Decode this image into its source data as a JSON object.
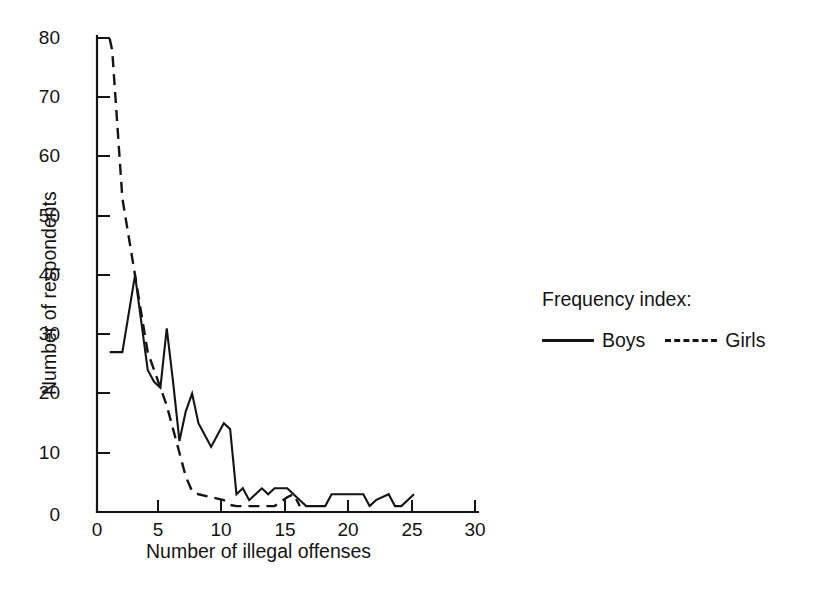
{
  "chart_data": {
    "type": "line",
    "title": "",
    "xlabel": "Number of illegal offenses",
    "ylabel": "Number of respondents",
    "xlim": [
      0,
      30
    ],
    "ylim": [
      0,
      80
    ],
    "xticks": [
      "0",
      "5",
      "10",
      "15",
      "20",
      "25",
      "30"
    ],
    "yticks": [
      "0",
      "10",
      "20",
      "30",
      "40",
      "50",
      "60",
      "70",
      "80"
    ],
    "grid": false,
    "legend_position": "right",
    "legend_title": "Frequency index:",
    "series": [
      {
        "name": "Boys",
        "style": "solid",
        "color": "#141414",
        "x": [
          1,
          2,
          3,
          4,
          4.5,
          5,
          5.5,
          6,
          6.5,
          7,
          7.5,
          8,
          8.5,
          9,
          9.5,
          10,
          10.5,
          11,
          11.5,
          12,
          12.5,
          13,
          13.5,
          14,
          14.5,
          15,
          15.5,
          16,
          16.5,
          17,
          18,
          18.5,
          19,
          20,
          21,
          21.5,
          22,
          23,
          23.5,
          24,
          25
        ],
        "y": [
          27,
          27,
          40,
          24,
          22,
          21,
          31,
          22,
          12,
          17,
          20,
          15,
          13,
          11,
          13,
          15,
          14,
          3,
          4,
          2,
          3,
          4,
          3,
          4,
          4,
          4,
          3,
          2,
          1,
          1,
          1,
          3,
          3,
          3,
          3,
          1,
          2,
          3,
          1,
          1,
          3
        ]
      },
      {
        "name": "Girls",
        "style": "dashed",
        "color": "#141414",
        "x": [
          1,
          1.2,
          2,
          3,
          4,
          5,
          5.5,
          6,
          6.5,
          7,
          7.5,
          8,
          9,
          10,
          10.5,
          11,
          12,
          13,
          14,
          15,
          15.5,
          16
        ],
        "y": [
          80,
          78,
          53,
          40,
          27,
          21,
          18,
          14,
          10,
          6,
          3.5,
          3,
          2.5,
          2,
          1.2,
          1,
          1,
          1,
          1,
          2.5,
          3,
          1
        ]
      }
    ]
  },
  "legend": {
    "title": "Frequency index:",
    "entries": [
      {
        "label": "Boys",
        "style": "solid"
      },
      {
        "label": "Girls",
        "style": "dashed"
      }
    ]
  },
  "axes": {
    "x_title": "Number of illegal offenses",
    "y_title": "Number of respondents"
  }
}
